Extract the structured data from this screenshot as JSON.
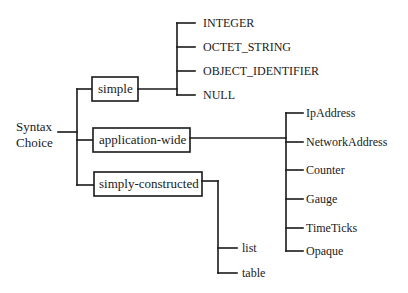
{
  "diagram": {
    "root": {
      "line1": "Syntax",
      "line2": "Choice"
    },
    "categories": [
      {
        "label": "simple",
        "children": [
          "INTEGER",
          "OCTET_STRING",
          "OBJECT_IDENTIFIER",
          "NULL"
        ]
      },
      {
        "label": "application-wide",
        "children": [
          "IpAddress",
          "NetworkAddress",
          "Counter",
          "Gauge",
          "TimeTicks",
          "Opaque"
        ]
      },
      {
        "label": "simply-constructed",
        "children": [
          "list",
          "table"
        ]
      }
    ]
  }
}
